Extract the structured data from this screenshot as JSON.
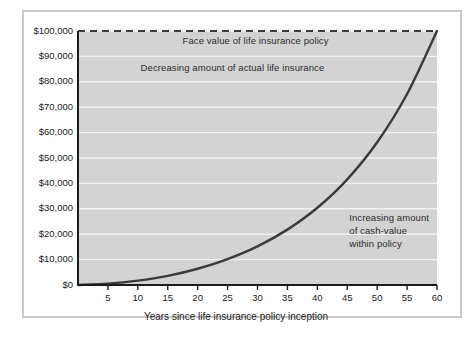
{
  "chart_data": {
    "type": "line",
    "title": "",
    "xlabel": "Years since life insurance policy inception",
    "ylabel": "",
    "xlim": [
      0,
      60
    ],
    "ylim": [
      0,
      100000
    ],
    "grid": true,
    "legend_position": "none",
    "x_ticks": [
      "5",
      "10",
      "15",
      "20",
      "25",
      "30",
      "35",
      "40",
      "45",
      "50",
      "55",
      "60"
    ],
    "x_tick_values": [
      5,
      10,
      15,
      20,
      25,
      30,
      35,
      40,
      45,
      50,
      55,
      60
    ],
    "y_ticks": [
      "$0",
      "$10,000",
      "$20,000",
      "$30,000",
      "$40,000",
      "$50,000",
      "$60,000",
      "$70,000",
      "$80,000",
      "$90,000",
      "$100,000"
    ],
    "y_tick_values": [
      0,
      10000,
      20000,
      30000,
      40000,
      50000,
      60000,
      70000,
      80000,
      90000,
      100000
    ],
    "series": [
      {
        "name": "Face value of life insurance policy",
        "style": "dashed",
        "color": "#3a3a3a",
        "x": [
          0,
          60
        ],
        "values": [
          100000,
          100000
        ]
      },
      {
        "name": "Cash value within policy",
        "style": "solid",
        "color": "#3a3a3a",
        "x": [
          0,
          5,
          10,
          15,
          20,
          25,
          30,
          35,
          40,
          45,
          50,
          55,
          60
        ],
        "values": [
          0,
          500,
          1700,
          3600,
          6400,
          10200,
          15200,
          21800,
          30400,
          41600,
          56200,
          75200,
          100000
        ]
      }
    ],
    "annotations": [
      {
        "id": "face-value",
        "text": "Face value of life insurance policy",
        "x": 30,
        "y": 96000
      },
      {
        "id": "decreasing-insurance",
        "text": "Decreasing amount of actual life insurance",
        "x": 26,
        "y": 85500
      },
      {
        "id": "increasing-cash-value",
        "lines": [
          "Increasing amount",
          "of cash-value",
          "within policy"
        ],
        "x": 45,
        "y": 26000
      }
    ],
    "colors": {
      "plot_background": "#d3d3d3",
      "gridline": "#f2f2f2",
      "axis": "#1c1c1c",
      "curve": "#3a3a3a",
      "dashed_line": "#3a3a3a",
      "frame_border": "#c9c9c9",
      "page_background": "#ffffff",
      "text": "#1c1c1c"
    }
  }
}
